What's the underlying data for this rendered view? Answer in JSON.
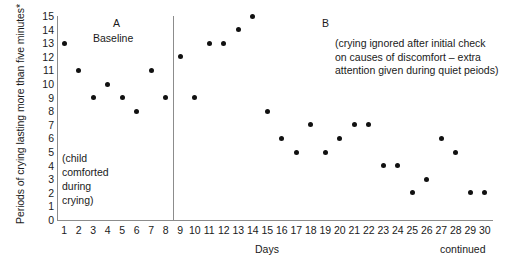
{
  "chart_data": {
    "type": "scatter",
    "title": "",
    "xlabel": "Days",
    "ylabel": "Periods of crying lasting more than five minutes*",
    "xlim": [
      0.5,
      30.5
    ],
    "ylim": [
      0,
      15
    ],
    "grid": false,
    "legend": "none",
    "x": [
      1,
      2,
      3,
      4,
      5,
      6,
      7,
      8,
      9,
      10,
      11,
      12,
      13,
      14,
      15,
      16,
      17,
      18,
      19,
      20,
      21,
      22,
      23,
      24,
      25,
      26,
      27,
      28,
      29,
      30
    ],
    "values": [
      13,
      11,
      9,
      10,
      9,
      8,
      11,
      9,
      12,
      9,
      13,
      13,
      14,
      15,
      8,
      6,
      5,
      7,
      5,
      6,
      7,
      7,
      4,
      4,
      2,
      3,
      6,
      5,
      2,
      2
    ],
    "series": [
      {
        "name": "Periods of crying lasting more than five minutes",
        "points": [
          {
            "day": 1,
            "value": 13
          },
          {
            "day": 2,
            "value": 11
          },
          {
            "day": 3,
            "value": 9
          },
          {
            "day": 4,
            "value": 10
          },
          {
            "day": 5,
            "value": 9
          },
          {
            "day": 6,
            "value": 8
          },
          {
            "day": 7,
            "value": 11
          },
          {
            "day": 8,
            "value": 9
          },
          {
            "day": 9,
            "value": 12
          },
          {
            "day": 10,
            "value": 9
          },
          {
            "day": 11,
            "value": 13
          },
          {
            "day": 12,
            "value": 13
          },
          {
            "day": 13,
            "value": 14
          },
          {
            "day": 14,
            "value": 15
          },
          {
            "day": 15,
            "value": 8
          },
          {
            "day": 16,
            "value": 6
          },
          {
            "day": 17,
            "value": 5
          },
          {
            "day": 18,
            "value": 7
          },
          {
            "day": 19,
            "value": 5
          },
          {
            "day": 20,
            "value": 6
          },
          {
            "day": 21,
            "value": 7
          },
          {
            "day": 22,
            "value": 7
          },
          {
            "day": 23,
            "value": 4
          },
          {
            "day": 24,
            "value": 4
          },
          {
            "day": 25,
            "value": 2
          },
          {
            "day": 26,
            "value": 3
          },
          {
            "day": 27,
            "value": 6
          },
          {
            "day": 28,
            "value": 5
          },
          {
            "day": 29,
            "value": 2
          },
          {
            "day": 30,
            "value": 2
          }
        ]
      }
    ],
    "y_ticks": [
      "15",
      "14",
      "13",
      "12",
      "11",
      "10",
      "9",
      "8",
      "7",
      "6",
      "5",
      "4",
      "3",
      "2",
      "1",
      "0"
    ],
    "x_ticks": [
      "1",
      "2",
      "3",
      "4",
      "5",
      "6",
      "7",
      "8",
      "9",
      "10",
      "11",
      "12",
      "13",
      "14",
      "15",
      "16",
      "17",
      "18",
      "19",
      "20",
      "21",
      "22",
      "23",
      "24",
      "25",
      "26",
      "27",
      "28",
      "29",
      "30"
    ],
    "phases": [
      {
        "letter": "A",
        "subtitle": "Baseline",
        "note_lines": [
          "(child",
          "comforted",
          "during",
          "crying)"
        ],
        "day_range": [
          1,
          8
        ]
      },
      {
        "letter": "B",
        "subtitle": "",
        "note": "(crying ignored after initial check on causes of discomfort – extra attention given during quiet peiods)",
        "day_range": [
          9,
          30
        ]
      }
    ],
    "annotations": {
      "continued": "continued"
    },
    "colors": {
      "marker": "#111111",
      "axis": "#8c8c8c",
      "text": "#1a1a1a",
      "background": "#ffffff"
    }
  }
}
